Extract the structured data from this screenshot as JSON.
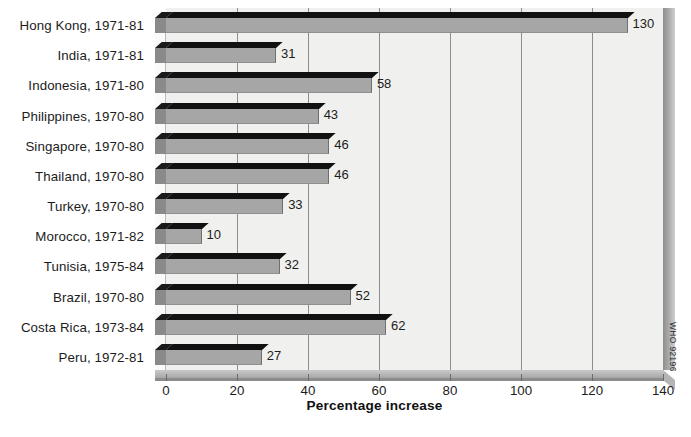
{
  "chart_data": {
    "type": "bar",
    "orientation": "horizontal",
    "title": "",
    "xlabel": "Percentage increase",
    "ylabel": "",
    "xlim": [
      0,
      140
    ],
    "xticks": [
      0,
      20,
      40,
      60,
      80,
      100,
      120,
      140
    ],
    "grid": true,
    "grid_axis": "x",
    "legend": "none",
    "categories": [
      "Hong Kong, 1971-81",
      "India, 1971-81",
      "Indonesia, 1971-80",
      "Philippines, 1970-80",
      "Singapore, 1970-80",
      "Thailand, 1970-80",
      "Turkey, 1970-80",
      "Morocco, 1971-82",
      "Tunisia, 1975-84",
      "Brazil, 1970-80",
      "Costa Rica, 1973-84",
      "Peru, 1972-81"
    ],
    "values": [
      130,
      31,
      58,
      43,
      46,
      46,
      33,
      10,
      32,
      52,
      62,
      27
    ],
    "data_labels": [
      "130",
      "31",
      "58",
      "43",
      "46",
      "46",
      "33",
      "10",
      "32",
      "52",
      "62",
      "27"
    ],
    "style": {
      "bar_front_color": "#a6a6a6",
      "bar_top_color": "#111111",
      "bar_side_color": "#8a8a8a",
      "plot_background": "#f0f0ee",
      "gridline_color": "#8d8d8d",
      "text_color": "#1c1c1c"
    }
  },
  "axis": {
    "x_tick_labels": [
      "0",
      "20",
      "40",
      "60",
      "80",
      "100",
      "120",
      "140"
    ],
    "x_title": "Percentage increase"
  },
  "credit": {
    "text": "WHO 92196"
  }
}
